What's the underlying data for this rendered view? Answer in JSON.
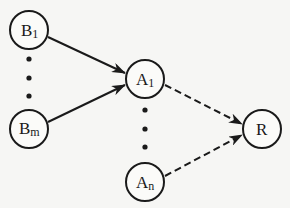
{
  "diagram": {
    "type": "directed graph",
    "nodes": [
      {
        "id": "B1",
        "base": "B",
        "sub": "1",
        "cx": 29,
        "cy": 30
      },
      {
        "id": "Bm",
        "base": "B",
        "sub": "m",
        "cx": 29,
        "cy": 129
      },
      {
        "id": "A1",
        "base": "A",
        "sub": "1",
        "cx": 145,
        "cy": 79
      },
      {
        "id": "An",
        "base": "A",
        "sub": "n",
        "cx": 145,
        "cy": 182
      },
      {
        "id": "R",
        "base": "R",
        "sub": "",
        "cx": 262,
        "cy": 129
      }
    ],
    "edges": [
      {
        "from": "B1",
        "to": "A1",
        "style": "solid"
      },
      {
        "from": "Bm",
        "to": "A1",
        "style": "solid"
      },
      {
        "from": "A1",
        "to": "R",
        "style": "dashed"
      },
      {
        "from": "An",
        "to": "R",
        "style": "dashed"
      }
    ],
    "ellipses": [
      {
        "between": [
          "B1",
          "Bm"
        ],
        "dots": 3
      },
      {
        "between": [
          "A1",
          "An"
        ],
        "dots": 3
      }
    ],
    "colors": {
      "stroke": "#1a1a1a",
      "background": "#f6f6f4"
    }
  }
}
